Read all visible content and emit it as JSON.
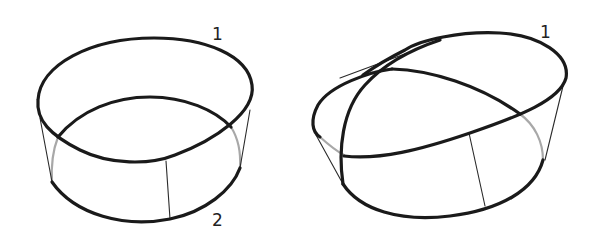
{
  "figures": [
    {
      "name": "left-ring-band",
      "labels": {
        "top_edge": "1",
        "bottom_edge": "2"
      }
    },
    {
      "name": "right-twisted-band",
      "labels": {
        "top_edge": "1"
      }
    }
  ],
  "colors": {
    "stroke_primary": "#1a1a1a",
    "stroke_hidden": "#a8a8a8",
    "background": "#ffffff"
  }
}
